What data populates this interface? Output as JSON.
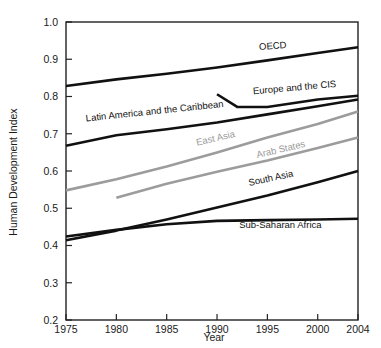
{
  "chart_data": {
    "type": "line",
    "title": "",
    "xlabel": "Year",
    "ylabel": "Human Development Index",
    "xlim": [
      1975,
      2004
    ],
    "ylim": [
      0.2,
      1.0
    ],
    "grid": false,
    "legend": "inline-labels",
    "xticks": [
      "1975",
      "1980",
      "1985",
      "1990",
      "1995",
      "2000",
      "2004"
    ],
    "xtick_values": [
      1975,
      1980,
      1985,
      1990,
      1995,
      2000,
      2004
    ],
    "yticks": [
      "0.2",
      "0.3",
      "0.4",
      "0.5",
      "0.6",
      "0.7",
      "0.8",
      "0.9",
      "1.0"
    ],
    "ytick_values": [
      0.2,
      0.3,
      0.4,
      0.5,
      0.6,
      0.7,
      0.8,
      0.9,
      1.0
    ],
    "series": [
      {
        "name": "OECD",
        "color": "#111111",
        "label_x": 1994.2,
        "label_y": 0.925,
        "label_rotation": -4,
        "x": [
          1975,
          1980,
          1985,
          1990,
          1995,
          2000,
          2004
        ],
        "values": [
          0.828,
          0.846,
          0.861,
          0.878,
          0.897,
          0.917,
          0.932
        ]
      },
      {
        "name": "Europe and the CIS",
        "color": "#111111",
        "label_x": 1993.6,
        "label_y": 0.806,
        "label_rotation": -5,
        "x": [
          1990,
          1992,
          1995,
          2000,
          2004
        ],
        "values": [
          0.806,
          0.772,
          0.772,
          0.792,
          0.802
        ]
      },
      {
        "name": "Latin America and the Caribbean",
        "color": "#111111",
        "label_x": 1977.0,
        "label_y": 0.733,
        "label_rotation": -6,
        "x": [
          1975,
          1980,
          1985,
          1990,
          1995,
          2000,
          2004
        ],
        "values": [
          0.668,
          0.696,
          0.712,
          0.73,
          0.752,
          0.774,
          0.792
        ]
      },
      {
        "name": "East Asia",
        "color": "#9c9c9c",
        "label_x": 1988.0,
        "label_y": 0.668,
        "label_rotation": -13,
        "x": [
          1975,
          1980,
          1985,
          1990,
          1995,
          2000,
          2004
        ],
        "values": [
          0.548,
          0.578,
          0.612,
          0.65,
          0.69,
          0.726,
          0.76
        ]
      },
      {
        "name": "Arab States",
        "color": "#9c9c9c",
        "label_x": 1994.0,
        "label_y": 0.635,
        "label_rotation": -13,
        "x": [
          1980,
          1985,
          1990,
          1995,
          2000,
          2004
        ],
        "values": [
          0.528,
          0.566,
          0.598,
          0.628,
          0.662,
          0.69
        ]
      },
      {
        "name": "South Asia",
        "color": "#111111",
        "label_x": 1993.2,
        "label_y": 0.56,
        "label_rotation": -12,
        "x": [
          1975,
          1980,
          1985,
          1990,
          1995,
          2000,
          2004
        ],
        "values": [
          0.414,
          0.44,
          0.47,
          0.502,
          0.534,
          0.57,
          0.6
        ]
      },
      {
        "name": "Sub-Saharan Africa",
        "color": "#111111",
        "label_x": 1992.2,
        "label_y": 0.446,
        "label_rotation": 0,
        "x": [
          1975,
          1980,
          1985,
          1990,
          1995,
          2000,
          2004
        ],
        "values": [
          0.424,
          0.442,
          0.457,
          0.466,
          0.468,
          0.47,
          0.472
        ]
      }
    ]
  }
}
